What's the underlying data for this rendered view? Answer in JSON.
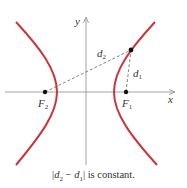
{
  "diagram": {
    "axes": {
      "x_label": "x",
      "y_label": "y",
      "color": "#8a8a8a"
    },
    "curve": {
      "color": "#c8373c",
      "branches": [
        "left",
        "right"
      ]
    },
    "foci": [
      {
        "label": "F",
        "subscript": "2",
        "x": 45,
        "y": 92
      },
      {
        "label": "F",
        "subscript": "1",
        "x": 126,
        "y": 92
      }
    ],
    "point_on_curve": {
      "x": 131,
      "y": 50
    },
    "distances": [
      {
        "label": "d",
        "subscript": "2",
        "from": "F2",
        "to": "P"
      },
      {
        "label": "d",
        "subscript": "1",
        "from": "F1",
        "to": "P"
      }
    ],
    "caption": {
      "open": "|",
      "d2": "d",
      "d2_sub": "2",
      "minus": " − ",
      "d1": "d",
      "d1_sub": "1",
      "close": "|",
      "rest": " is constant."
    }
  }
}
